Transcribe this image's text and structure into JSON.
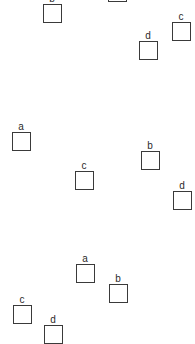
{
  "groups": [
    {
      "id": "group-1",
      "items": [
        {
          "label": "b",
          "x": 43,
          "y": 4
        },
        {
          "label": "",
          "x": 108,
          "y": -17
        },
        {
          "label": "c",
          "x": 172,
          "y": 22
        },
        {
          "label": "d",
          "x": 139,
          "y": 41
        }
      ]
    },
    {
      "id": "group-2",
      "items": [
        {
          "label": "a",
          "x": 12,
          "y": 132
        },
        {
          "label": "c",
          "x": 75,
          "y": 171
        },
        {
          "label": "b",
          "x": 141,
          "y": 151
        },
        {
          "label": "d",
          "x": 173,
          "y": 191
        }
      ]
    },
    {
      "id": "group-3",
      "items": [
        {
          "label": "a",
          "x": 76,
          "y": 264
        },
        {
          "label": "b",
          "x": 109,
          "y": 284
        },
        {
          "label": "c",
          "x": 13,
          "y": 305
        },
        {
          "label": "d",
          "x": 44,
          "y": 325
        }
      ]
    }
  ]
}
